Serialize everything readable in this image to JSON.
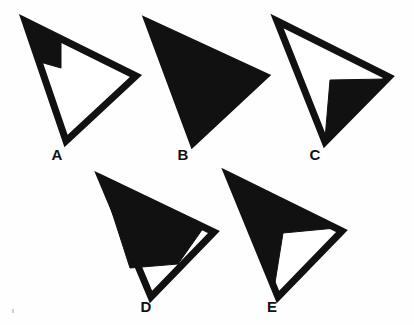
{
  "figure": {
    "background_color": "#fefefe",
    "ink_color": "#111111",
    "shade_color": "#111111",
    "fill_color": "#ffffff",
    "stroke_width": 7,
    "shape_count": 5
  },
  "shapes": [
    {
      "id": "A",
      "label": "A",
      "label_x": 57,
      "label_y": 160,
      "description": "Triangle outline, unshaded interior except a small black block at the top-left apex",
      "shading": "small-corner-block",
      "shaded_fraction": "about 1/8",
      "outline_points": "25,21 136,76 66,141",
      "shaded_points": "25,21 61,39 61,68 40,62",
      "vertices": [
        {
          "name": "apex-top-left",
          "x": 25,
          "y": 21
        },
        {
          "name": "vertex-right",
          "x": 136,
          "y": 76
        },
        {
          "name": "vertex-bottom",
          "x": 66,
          "y": 141
        }
      ]
    },
    {
      "id": "B",
      "label": "B",
      "label_x": 183,
      "label_y": 160,
      "description": "Triangle entirely filled black",
      "shading": "full",
      "shaded_fraction": "all",
      "outline_points": "148,22 265,76 193,143",
      "shaded_points": "148,22 265,76 193,143",
      "vertices": [
        {
          "name": "apex-top-left",
          "x": 148,
          "y": 22
        },
        {
          "name": "vertex-right",
          "x": 265,
          "y": 76
        },
        {
          "name": "vertex-bottom",
          "x": 193,
          "y": 143
        }
      ]
    },
    {
      "id": "C",
      "label": "C",
      "label_x": 315,
      "label_y": 160,
      "description": "Triangle outline with the lower-right interior region filled black",
      "shading": "lower-right-region",
      "shaded_fraction": "about 1/2",
      "outline_points": "277,21 389,77 325,142",
      "shaded_points": "330,80 386,79 325,139",
      "vertices": [
        {
          "name": "apex-top-left",
          "x": 277,
          "y": 21
        },
        {
          "name": "vertex-right",
          "x": 389,
          "y": 77
        },
        {
          "name": "vertex-bottom",
          "x": 325,
          "y": 142
        }
      ]
    },
    {
      "id": "D",
      "label": "D",
      "label_x": 146,
      "label_y": 312,
      "description": "Triangle mostly filled black with a white triangle at the right vertex and a white triangle at the bottom",
      "shading": "mostly-filled-two-white-notches",
      "shaded_fraction": "about 3/4",
      "outline_points": "101,178 214,232 151,297",
      "shaded_points": "101,178 204,227 178,264 130,268",
      "vertices": [
        {
          "name": "apex-top-left",
          "x": 101,
          "y": 178
        },
        {
          "name": "vertex-right",
          "x": 214,
          "y": 232
        },
        {
          "name": "vertex-bottom",
          "x": 151,
          "y": 297
        }
      ]
    },
    {
      "id": "E",
      "label": "E",
      "label_x": 272,
      "label_y": 312,
      "description": "Triangle mostly filled black with a white wedge opening toward the right vertex",
      "shading": "mostly-filled-white-wedge",
      "shaded_fraction": "about 3/4",
      "outline_points": "228,175 342,231 278,297",
      "shaded_points": "228,175 336,228 283,233 274,289",
      "vertices": [
        {
          "name": "apex-top-left",
          "x": 228,
          "y": 175
        },
        {
          "name": "vertex-right",
          "x": 342,
          "y": 231
        },
        {
          "name": "vertex-bottom",
          "x": 278,
          "y": 297
        }
      ]
    }
  ],
  "artifacts": [
    {
      "name": "speck-left",
      "x": 12,
      "y": 309,
      "w": 2,
      "h": 4
    }
  ]
}
